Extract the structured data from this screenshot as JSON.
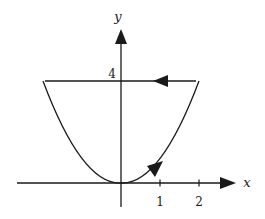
{
  "diagram": {
    "type": "closed-curve-plot",
    "axes": {
      "x_label": "x",
      "y_label": "y",
      "x_ticks": [
        "1",
        "2"
      ],
      "y_ticks": [
        "4"
      ]
    },
    "curve": {
      "equation": "y = x^2",
      "x_range": [
        -2,
        2
      ],
      "closing_segment": "y = 4"
    },
    "arrows": [
      {
        "on": "parabola",
        "near": [
          0.8,
          0.64
        ],
        "direction": "up-right"
      },
      {
        "on": "top-segment",
        "near": [
          1.1,
          4
        ],
        "direction": "left"
      }
    ],
    "colors": {
      "stroke": "#1a1a1a",
      "background": "#ffffff"
    }
  }
}
